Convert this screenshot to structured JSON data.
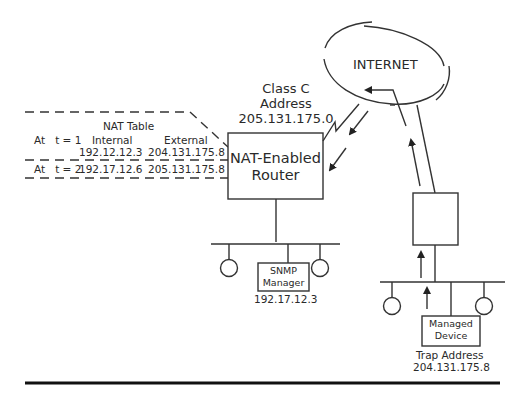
{
  "nat_table": {
    "title": "NAT Table",
    "columns": [
      "",
      "Internal",
      "External"
    ],
    "rows": [
      {
        "time_label": "At   t = 1",
        "internal": "192.12.12.3",
        "external": "204.131.175.8"
      },
      {
        "time_label": "At   t = 2",
        "internal": "192.17.12.6",
        "external": "205.131.175.8"
      }
    ]
  },
  "class_c": {
    "line1": "Class C",
    "line2": "Address",
    "address": "205.131.175.0"
  },
  "router": {
    "line1": "NAT-Enabled",
    "line2": "Router"
  },
  "internet": {
    "label": "INTERNET"
  },
  "snmp_manager": {
    "line1": "SNMP",
    "line2": "Manager",
    "address": "192.17.12.3"
  },
  "managed_device": {
    "line1": "Managed",
    "line2": "Device",
    "trap_label": "Trap Address",
    "trap_address": "204.131.175.8"
  }
}
